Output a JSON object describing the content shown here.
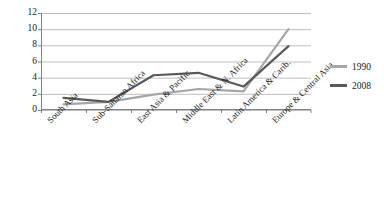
{
  "chart_data": {
    "type": "line",
    "title": "",
    "xlabel": "",
    "ylabel": "",
    "categories": [
      "South Asia",
      "Sub-Saharan Africa",
      "East Asia & Pacific",
      "Middle East & N. Africa",
      "Latin America & Carib.",
      "Europe & Central Asia"
    ],
    "series": [
      {
        "name": "1990",
        "color": "#a6a6a6",
        "values": [
          0.7,
          1.0,
          1.9,
          2.6,
          2.3,
          10.0
        ]
      },
      {
        "name": "2008",
        "color": "#595959",
        "values": [
          1.5,
          1.0,
          4.3,
          4.6,
          2.9,
          7.9
        ]
      }
    ],
    "ylim": [
      0,
      12
    ],
    "yticks": [
      0,
      2,
      4,
      6,
      8,
      10,
      12
    ],
    "ytick_labels": [
      "0",
      "2",
      "4",
      "6",
      "8",
      "10",
      "12"
    ],
    "grid": "horizontal",
    "legend_position": "right",
    "axis_color": "#808080",
    "grid_color": "#bfbfbf"
  }
}
